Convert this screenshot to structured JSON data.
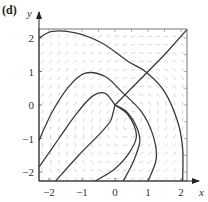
{
  "panel": {
    "label": "(d)"
  },
  "chart_data": {
    "type": "line",
    "subtype": "phase-portrait-with-direction-field",
    "title": "",
    "xlabel": "x",
    "ylabel": "y",
    "xlim": [
      -2.3,
      2.2
    ],
    "ylim": [
      -2.27,
      2.27
    ],
    "xticks": [
      -2,
      -1,
      0,
      1,
      2
    ],
    "yticks": [
      -2,
      -1,
      0,
      1,
      2
    ],
    "xtick_labels": [
      "−2",
      "−1",
      "0",
      "1",
      "2"
    ],
    "ytick_labels": [
      "2",
      "1",
      "0",
      "−1",
      "−2"
    ],
    "grid": false,
    "direction_field": true,
    "equilibrium": [
      0,
      0
    ],
    "series": [
      {
        "name": "diagonal-separatrix",
        "points": [
          [
            0,
            0
          ],
          [
            0.5,
            0.5
          ],
          [
            1,
            1
          ],
          [
            1.5,
            1.5
          ],
          [
            2.2,
            2.27
          ]
        ]
      },
      {
        "name": "outer-trajectory",
        "points": [
          [
            -2.3,
            2.0
          ],
          [
            -1.9,
            2.2
          ],
          [
            -1.2,
            2.15
          ],
          [
            -0.4,
            1.85
          ],
          [
            0.4,
            1.3
          ],
          [
            0.95,
            0.98
          ],
          [
            1.5,
            0.4
          ],
          [
            1.9,
            -0.5
          ],
          [
            2.05,
            -1.3
          ],
          [
            2.05,
            -2.27
          ]
        ]
      },
      {
        "name": "middle-trajectory",
        "points": [
          [
            -2.3,
            -1.05
          ],
          [
            -1.9,
            -0.2
          ],
          [
            -1.4,
            0.55
          ],
          [
            -0.9,
            0.95
          ],
          [
            -0.3,
            0.85
          ],
          [
            0.2,
            0.4
          ],
          [
            0.8,
            -0.2
          ],
          [
            1.15,
            -0.9
          ],
          [
            1.25,
            -1.6
          ],
          [
            1.0,
            -2.27
          ]
        ]
      },
      {
        "name": "inner-left-lobe",
        "points": [
          [
            -2.3,
            -1.85
          ],
          [
            -1.7,
            -1.0
          ],
          [
            -1.2,
            -0.3
          ],
          [
            -0.7,
            0.25
          ],
          [
            -0.3,
            0.35
          ],
          [
            0,
            0
          ]
        ]
      },
      {
        "name": "inner-right-lobe",
        "points": [
          [
            0,
            0
          ],
          [
            0.35,
            -0.2
          ],
          [
            0.65,
            -0.65
          ],
          [
            0.75,
            -1.1
          ],
          [
            0.55,
            -1.7
          ],
          [
            0.25,
            -2.27
          ]
        ]
      },
      {
        "name": "inner-loop",
        "points": [
          [
            -1.8,
            -2.27
          ],
          [
            -1.1,
            -1.5
          ],
          [
            -0.5,
            -0.9
          ],
          [
            -0.15,
            -0.5
          ],
          [
            -0.05,
            -0.2
          ],
          [
            0,
            0
          ]
        ]
      },
      {
        "name": "lower-trajectory",
        "points": [
          [
            -0.6,
            -2.27
          ],
          [
            0.0,
            -1.9
          ],
          [
            0.45,
            -1.4
          ],
          [
            0.65,
            -0.9
          ],
          [
            0.4,
            -0.3
          ],
          [
            0,
            0
          ]
        ]
      }
    ]
  }
}
